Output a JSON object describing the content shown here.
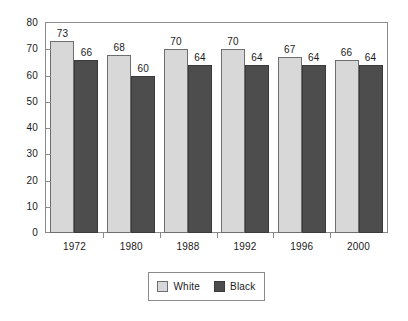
{
  "chart_data": {
    "type": "bar",
    "title": "",
    "subtitle": "",
    "xlabel": "",
    "ylabel": "",
    "categories": [
      "1972",
      "1980",
      "1988",
      "1992",
      "1996",
      "2000"
    ],
    "series": [
      {
        "name": "White",
        "color": "#d8d8d8",
        "values": [
          73,
          68,
          70,
          70,
          67,
          66
        ]
      },
      {
        "name": "Black",
        "color": "#4d4d4d",
        "values": [
          66,
          60,
          64,
          64,
          64,
          64
        ]
      }
    ],
    "ylim": [
      0,
      80
    ],
    "yticks": [
      0,
      10,
      20,
      30,
      40,
      50,
      60,
      70,
      80
    ],
    "ytick_labels": [
      "0",
      "10",
      "20",
      "30",
      "40",
      "50",
      "60",
      "70",
      "80"
    ],
    "grid": false,
    "legend_position": "bottom-center",
    "data_labels": true,
    "frame": true
  },
  "legend": {
    "entries": [
      {
        "label": "White",
        "swatch": "white-swatch"
      },
      {
        "label": "Black",
        "swatch": "black-swatch"
      }
    ]
  }
}
